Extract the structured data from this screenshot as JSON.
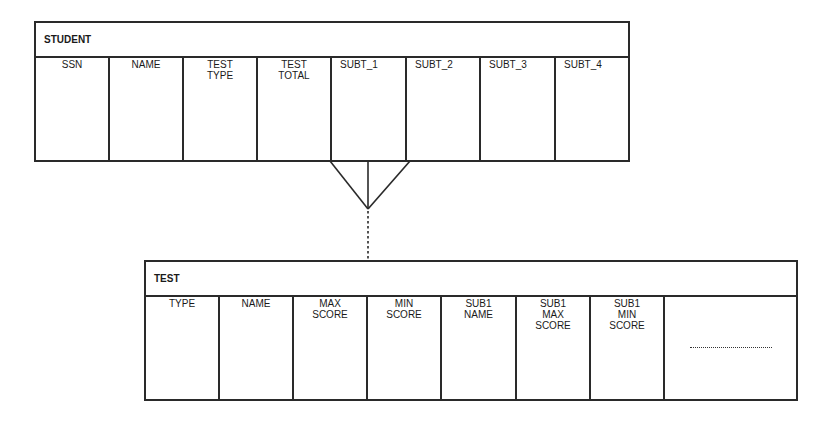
{
  "student": {
    "title": "STUDENT",
    "columns": [
      {
        "label": "SSN"
      },
      {
        "label": "NAME"
      },
      {
        "label": "TEST\nTYPE"
      },
      {
        "label": "TEST\nTOTAL"
      },
      {
        "label": "SUBT_1"
      },
      {
        "label": "SUBT_2"
      },
      {
        "label": "SUBT_3"
      },
      {
        "label": "SUBT_4"
      }
    ]
  },
  "test": {
    "title": "TEST",
    "columns": [
      {
        "label": "TYPE"
      },
      {
        "label": "NAME"
      },
      {
        "label": "MAX\nSCORE"
      },
      {
        "label": "MIN\nSCORE"
      },
      {
        "label": "SUB1\nNAME"
      },
      {
        "label": "SUB1\nMAX\nSCORE"
      },
      {
        "label": "SUB1\nMIN\nSCORE"
      },
      {
        "label": ""
      }
    ],
    "ellipsis": "continuation"
  },
  "relationship": {
    "type": "one-to-many",
    "from": "TEST",
    "to": "STUDENT",
    "notation": "crow's foot with dotted (optional) line"
  }
}
